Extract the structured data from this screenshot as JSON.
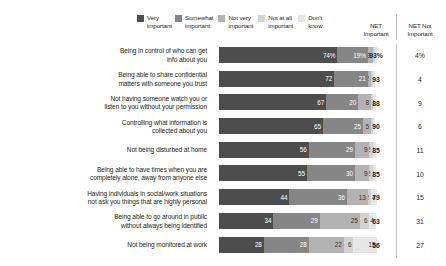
{
  "legend": {
    "items": [
      {
        "label": "Very\nimportant",
        "color": "#4d4d4d",
        "key": "very_important"
      },
      {
        "label": "Somewhat\nimportant",
        "color": "#868686",
        "key": "somewhat_important"
      },
      {
        "label": "Not very\nimportant",
        "color": "#b3b3b3",
        "key": "not_very_important"
      },
      {
        "label": "Not at all\nimportant",
        "color": "#d2d2d2",
        "key": "not_at_all_important"
      },
      {
        "label": "Don't\nknow",
        "color": "#e6e6e6",
        "key": "dont_know"
      }
    ]
  },
  "columns": {
    "net_important_header": "NET\nImportant",
    "net_not_important_header": "NET Not\nImportant"
  },
  "chart_data": {
    "type": "bar",
    "subtype": "stacked-horizontal-100",
    "title": "",
    "xlabel": "",
    "ylabel": "",
    "xlim": [
      0,
      100
    ],
    "grid": false,
    "legend_position": "top",
    "categories": [
      "Being in control of who can get\ninfo about you",
      "Being able to share confidential\nmatters with someone you trust",
      "Not having someone watch you or\nlisten to you without your permission",
      "Controlling what information is\ncollected about you",
      "Not being disturbed at home",
      "Being able to have times when you are\ncompletely alone, away from anyone else",
      "Having individuals in social/work situations\nnot ask you things that are highly personal",
      "Being able to go around in public\nwithout always being identified",
      "Not being monitored at work"
    ],
    "series": [
      {
        "name": "Very important",
        "values": [
          74,
          72,
          67,
          65,
          56,
          55,
          44,
          34,
          28
        ]
      },
      {
        "name": "Somewhat important",
        "values": [
          19,
          21,
          20,
          25,
          29,
          30,
          36,
          29,
          28
        ]
      },
      {
        "name": "Not very important",
        "values": [
          3,
          2,
          8,
          5,
          9,
          9,
          13,
          25,
          22
        ]
      },
      {
        "name": "Not at all important",
        "values": [
          1,
          1,
          1,
          1,
          2,
          2,
          2,
          6,
          6
        ]
      },
      {
        "name": "Don't know",
        "values": [
          1,
          1,
          2,
          1,
          2,
          2,
          4,
          4,
          15
        ]
      }
    ],
    "labels": [
      [
        "74%",
        "19%",
        "3",
        "1",
        "1"
      ],
      [
        "72",
        "21",
        "2",
        "1",
        "1"
      ],
      [
        "67",
        "20",
        "8",
        "1",
        "2"
      ],
      [
        "65",
        "25",
        "5",
        "1",
        "1"
      ],
      [
        "56",
        "29",
        "9",
        "2",
        "2"
      ],
      [
        "55",
        "30",
        "9",
        "2",
        "2"
      ],
      [
        "44",
        "36",
        "13",
        "2",
        "4"
      ],
      [
        "34",
        "29",
        "25",
        "6",
        "4"
      ],
      [
        "28",
        "28",
        "22",
        "6",
        "15"
      ]
    ],
    "net_important": [
      "93%",
      "93",
      "88",
      "90",
      "85",
      "85",
      "79",
      "63",
      "56"
    ],
    "net_not_important": [
      "4%",
      "4",
      "9",
      "6",
      "11",
      "10",
      "15",
      "31",
      "27"
    ]
  }
}
